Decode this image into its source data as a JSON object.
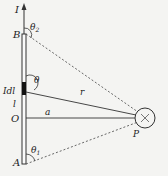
{
  "diagram": {
    "labels": {
      "current": "I",
      "point_b": "B",
      "theta2": "θ",
      "theta2_sub": "2",
      "element": "Idl",
      "theta": "θ",
      "r": "r",
      "l": "l",
      "origin": "O",
      "a": "a",
      "theta1": "θ",
      "theta1_sub": "1",
      "point_a": "A",
      "point_p": "P",
      "field_into_page": "×"
    },
    "colors": {
      "line": "#333333",
      "background": "#f4f4f2"
    }
  }
}
